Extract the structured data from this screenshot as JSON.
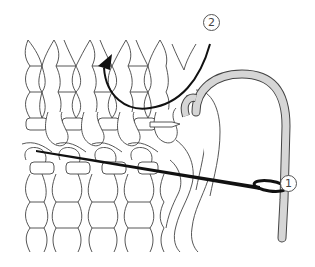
{
  "diagram": {
    "type": "knitting-grafting-illustration",
    "labels": [
      {
        "id": "1",
        "text": "1",
        "description": "needle entering stitch"
      },
      {
        "id": "2",
        "text": "2",
        "description": "yarn direction arrow"
      }
    ],
    "colors": {
      "line": "#444444",
      "yarn_fill": "#d6d6d6",
      "needle": "#111111",
      "background": "#ffffff"
    }
  }
}
